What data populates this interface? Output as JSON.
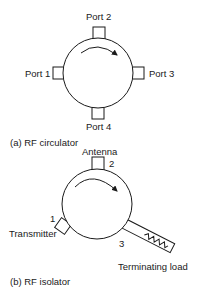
{
  "circulator": {
    "caption": "(a) RF circulator",
    "ports": [
      {
        "label": "Port 1"
      },
      {
        "label": "Port 2"
      },
      {
        "label": "Port 3"
      },
      {
        "label": "Port 4"
      }
    ],
    "rotation": "clockwise"
  },
  "isolator": {
    "caption": "(b) RF isolator",
    "ports": [
      {
        "number": "1",
        "label": "Transmitter"
      },
      {
        "number": "2",
        "label": "Antenna"
      },
      {
        "number": "3",
        "label": "Terminating load"
      }
    ],
    "rotation": "clockwise"
  },
  "colors": {
    "stroke": "#1a1a1a",
    "background": "#ffffff"
  }
}
